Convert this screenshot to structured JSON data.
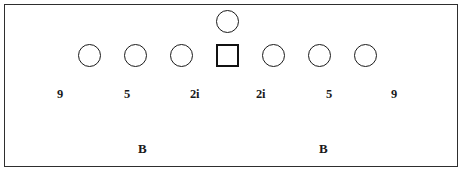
{
  "figure": {
    "background_color": "#ffffff",
    "stroke_color": "#1a1a1a",
    "frame_color": "#2e2e2e"
  },
  "diagram": {
    "main_row_nodes": [
      {
        "id": "node-1",
        "shape": "circle",
        "x": 78,
        "y": 44
      },
      {
        "id": "node-2",
        "shape": "circle",
        "x": 124,
        "y": 44
      },
      {
        "id": "node-3",
        "shape": "circle",
        "x": 170,
        "y": 44
      },
      {
        "id": "node-4",
        "shape": "square",
        "x": 216,
        "y": 44
      },
      {
        "id": "node-5",
        "shape": "circle",
        "x": 262,
        "y": 44
      },
      {
        "id": "node-6",
        "shape": "circle",
        "x": 308,
        "y": 44
      },
      {
        "id": "node-7",
        "shape": "circle",
        "x": 354,
        "y": 44
      }
    ],
    "branch_node": {
      "id": "node-branch",
      "shape": "circle",
      "x": 216,
      "y": 10
    },
    "index_labels": [
      {
        "text": "9",
        "x": 57,
        "y": 88
      },
      {
        "text": "5",
        "x": 124,
        "y": 88
      },
      {
        "text": "2i",
        "x": 190,
        "y": 88
      },
      {
        "text": "2i",
        "x": 256,
        "y": 88
      },
      {
        "text": "5",
        "x": 326,
        "y": 88
      },
      {
        "text": "9",
        "x": 391,
        "y": 88
      }
    ],
    "block_labels": [
      {
        "text": "B",
        "x": 138,
        "y": 142
      },
      {
        "text": "B",
        "x": 319,
        "y": 142
      }
    ]
  }
}
